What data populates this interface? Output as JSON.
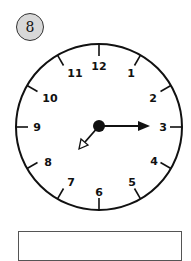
{
  "problem": {
    "number": "8"
  },
  "clock": {
    "numbers": [
      "12",
      "1",
      "2",
      "3",
      "4",
      "5",
      "6",
      "7",
      "8",
      "9",
      "10",
      "11"
    ],
    "hour_hand_points_to": "7.5",
    "minute_hand_points_to": "3",
    "time_shown": "7:15"
  },
  "answer_box": {
    "value": ""
  }
}
